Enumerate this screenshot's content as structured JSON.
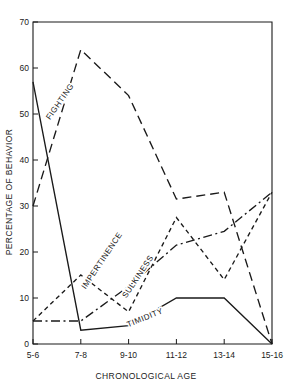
{
  "chart_data": {
    "type": "line",
    "title": "",
    "xlabel": "CHRONOLOGICAL AGE",
    "ylabel": "PERCENTAGE OF BEHAVIOR",
    "categories": [
      "5-6",
      "7-8",
      "9-10",
      "11-12",
      "13-14",
      "15-16"
    ],
    "xlim": [
      0,
      5
    ],
    "ylim": [
      0,
      70
    ],
    "yticks": [
      0,
      10,
      20,
      30,
      40,
      50,
      60,
      70
    ],
    "ytick_labels": [
      "0",
      "10",
      "20",
      "30",
      "40",
      "50",
      "60",
      "70"
    ],
    "grid": false,
    "legend": "inline-labels",
    "series": [
      {
        "name": "FIGHTING",
        "values": [
          30,
          64,
          54,
          31.5,
          33,
          0
        ],
        "dash": "long-dash",
        "label_x": 62,
        "label_y": 103,
        "label_rotate": -55
      },
      {
        "name": "IMPERTINENCE",
        "values": [
          5,
          5,
          12.5,
          21.5,
          24.5,
          33
        ],
        "dash": "dash-dot",
        "label_x": 104,
        "label_y": 262,
        "label_rotate": -56
      },
      {
        "name": "SULKINESS",
        "values": [
          5,
          15,
          7,
          27.5,
          14,
          33
        ],
        "dash": "short-dash",
        "label_x": 140,
        "label_y": 278,
        "label_rotate": -56
      },
      {
        "name": "TIMIDITY",
        "values": [
          57,
          3,
          4,
          10,
          10,
          0
        ],
        "dash": "solid",
        "label_x": 146,
        "label_y": 320,
        "label_rotate": -22
      }
    ]
  }
}
